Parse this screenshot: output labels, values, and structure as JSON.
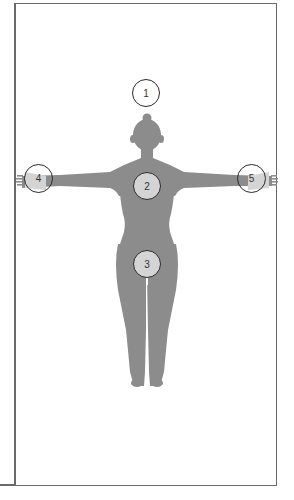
{
  "diagram": {
    "title": "",
    "figure": "front-view human body silhouette, arms outstretched",
    "colors": {
      "frame": "#6a6a6a",
      "silhouette": "#8c8c8c",
      "marker_border": "#2a2a2a",
      "marker_fill_on_body": "#d4d4d4",
      "marker_fill_empty": "#ffffff"
    },
    "markers": [
      {
        "id": "1",
        "label": "1",
        "location": "above head"
      },
      {
        "id": "2",
        "label": "2",
        "location": "chest"
      },
      {
        "id": "3",
        "label": "3",
        "location": "groin / pelvis"
      },
      {
        "id": "4",
        "label": "4",
        "location": "right hand (viewer's left)"
      },
      {
        "id": "5",
        "label": "5",
        "location": "left hand (viewer's right)"
      }
    ]
  }
}
